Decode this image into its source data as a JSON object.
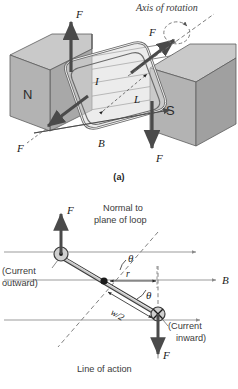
{
  "figure": {
    "type": "physics-diagram",
    "background_color": "#ffffff"
  },
  "panel_a": {
    "caption": "(a)",
    "labels": {
      "axis_of_rotation": "Axis of rotation",
      "force_top": "F",
      "force_right": "F",
      "force_left": "F",
      "force_bottom": "F",
      "field": "B",
      "current": "I",
      "length": "L",
      "magnet_north": "N",
      "magnet_south": "S"
    },
    "colors": {
      "magnet_face": "#b3b3b3",
      "magnet_top": "#c9c9c9",
      "magnet_side": "#9e9e9e",
      "loop_fill": "#d8d8d8",
      "arrow": "#4a4a4a",
      "field_line": "#6d6d6d"
    }
  },
  "panel_b": {
    "labels": {
      "normal_line1": "Normal to",
      "normal_line2": "plane of loop",
      "current_outward_line1": "(Current",
      "current_outward_line2": "outward)",
      "current_inward_line1": "(Current",
      "current_inward_line2": "inward)",
      "line_of_action": "Line of action",
      "force_up": "F",
      "force_down": "F",
      "field": "B",
      "theta_upper": "θ",
      "theta_lower": "θ",
      "radius": "r",
      "half_width": "w/2"
    },
    "icons": {
      "current_outward": "circle-dot-icon",
      "current_inward": "circle-cross-icon"
    },
    "field_lines": 3,
    "colors": {
      "rod_fill": "#c4c4c4",
      "rod_stroke": "#3c3c3c",
      "arrow": "#4a4a4a",
      "field_line": "#8a8a8a",
      "dashed": "#7a7a7a"
    }
  }
}
